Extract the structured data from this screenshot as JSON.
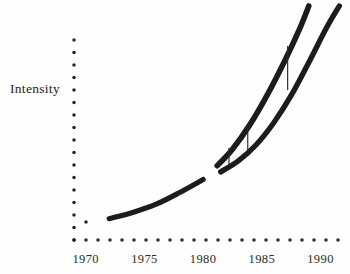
{
  "chart_data": {
    "type": "line",
    "title": "",
    "xlabel": "",
    "ylabel": "Intensity",
    "xlim": [
      1969.0,
      1992.0
    ],
    "ylim": [
      0,
      17
    ],
    "grid": false,
    "legend": null,
    "x_ticks": [
      "1970",
      "1975",
      "1980",
      "1985",
      "1990"
    ],
    "x_tick_values": [
      1970,
      1975,
      1980,
      1985,
      1990
    ],
    "y_ticks": [],
    "y_axis_style": "dotted-unlabeled",
    "x_axis_style": "dotted",
    "x_axis_dot_count": 23,
    "y_axis_dot_count": 17,
    "series": [
      {
        "name": "upper-curve",
        "points": [
          [
            1972.0,
            1.55
          ],
          [
            1974.0,
            2.0
          ],
          [
            1976.0,
            2.6
          ],
          [
            1978.0,
            3.45
          ],
          [
            1980.0,
            4.55
          ],
          [
            1981.2,
            5.4
          ],
          [
            1982.5,
            6.6
          ],
          [
            1984.0,
            8.4
          ],
          [
            1985.5,
            10.6
          ],
          [
            1987.0,
            13.1
          ],
          [
            1988.2,
            15.3
          ],
          [
            1989.0,
            17.0
          ]
        ]
      },
      {
        "name": "lower-curve",
        "points": [
          [
            1972.0,
            1.55
          ],
          [
            1974.0,
            2.0
          ],
          [
            1976.0,
            2.6
          ],
          [
            1978.0,
            3.45
          ],
          [
            1980.0,
            4.4
          ],
          [
            1981.5,
            4.95
          ],
          [
            1983.0,
            5.75
          ],
          [
            1984.5,
            6.9
          ],
          [
            1986.0,
            8.5
          ],
          [
            1987.5,
            10.5
          ],
          [
            1989.0,
            12.9
          ],
          [
            1990.5,
            15.4
          ],
          [
            1991.6,
            17.0
          ]
        ]
      }
    ],
    "annotations": [
      {
        "name": "gap-marker-1",
        "x": 1982.2,
        "y_low": 5.5,
        "y_high": 6.7
      },
      {
        "name": "gap-marker-2",
        "x": 1983.8,
        "y_low": 6.5,
        "y_high": 8.2
      },
      {
        "name": "gap-marker-3",
        "x": 1987.2,
        "y_low": 10.9,
        "y_high": 14.1
      }
    ],
    "branch_point": {
      "x": 1980.2,
      "y": 4.5
    },
    "colors": {
      "curve": "#1c1c1c",
      "axis_dots": "#242424",
      "text": "#2b2b2b",
      "background": "#fefefe"
    }
  }
}
